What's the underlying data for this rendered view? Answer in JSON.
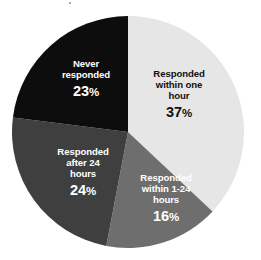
{
  "chart_data": {
    "type": "pie",
    "title": "",
    "subtitle": "",
    "xlabel": "",
    "ylabel": "",
    "legend_position": "none",
    "labels_inside_slices": true,
    "start_angle_deg": 0,
    "direction": "clockwise",
    "categories": [
      "Responded within one hour",
      "Responded within 1-24 hours",
      "Responded after 24 hours",
      "Never responded"
    ],
    "values": [
      37,
      16,
      24,
      23
    ],
    "value_suffix": "%",
    "colors": [
      "#e6e6e6",
      "#6e6e6e",
      "#3f3f3f",
      "#0d0d0d"
    ],
    "slices": [
      {
        "name": "responded-within-one-hour",
        "label_line1": "Responded",
        "label_line2": "within one",
        "label_line3": "hour",
        "value": "37",
        "percent_symbol": "%",
        "color": "#e6e6e6",
        "text_color": "#111111",
        "start_deg": 0,
        "end_deg": 133.2
      },
      {
        "name": "responded-within-1-24-hours",
        "label_line1": "Responded",
        "label_line2": "within 1-24",
        "label_line3": "hours",
        "value": "16",
        "percent_symbol": "%",
        "color": "#6e6e6e",
        "text_color": "#ffffff",
        "start_deg": 133.2,
        "end_deg": 190.8
      },
      {
        "name": "responded-after-24-hours",
        "label_line1": "Responded",
        "label_line2": "after 24",
        "label_line3": "hours",
        "value": "24",
        "percent_symbol": "%",
        "color": "#3f3f3f",
        "text_color": "#ffffff",
        "start_deg": 190.8,
        "end_deg": 277.2
      },
      {
        "name": "never-responded",
        "label_line1": "Never",
        "label_line2": "responded",
        "label_line3": "",
        "value": "23",
        "percent_symbol": "%",
        "color": "#0d0d0d",
        "text_color": "#ffffff",
        "start_deg": 277.2,
        "end_deg": 360
      }
    ],
    "geometry": {
      "center_x": 128,
      "center_y": 132,
      "radius": 116
    },
    "background_color": "#ffffff"
  }
}
